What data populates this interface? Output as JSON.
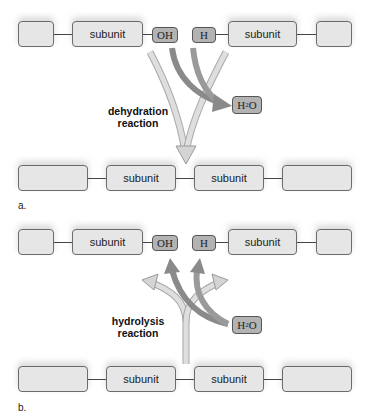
{
  "panel_a": {
    "letter": "a.",
    "reactants": {
      "left_chain": [
        "",
        "subunit"
      ],
      "left_group": "OH",
      "right_group": "H",
      "right_chain": [
        "subunit",
        ""
      ]
    },
    "reaction_label_line1": "dehydration",
    "reaction_label_line2": "reaction",
    "byproduct": {
      "main": "H",
      "sub": "2",
      "tail": "O"
    },
    "product_chain": [
      "",
      "subunit",
      "subunit",
      ""
    ]
  },
  "panel_b": {
    "letter": "b.",
    "products": {
      "left_chain": [
        "",
        "subunit"
      ],
      "left_group": "OH",
      "right_group": "H",
      "right_chain": [
        "subunit",
        ""
      ]
    },
    "reaction_label_line1": "hydrolysis",
    "reaction_label_line2": "reaction",
    "reagent": {
      "main": "H",
      "sub": "2",
      "tail": "O"
    },
    "reactant_chain": [
      "",
      "subunit",
      "subunit",
      ""
    ]
  },
  "colors": {
    "box_fill": "#e6e6e6",
    "group_fill": "#b3b3b3",
    "light_arrow": "#d0d0d0",
    "dark_arrow": "#8a8a8a"
  }
}
